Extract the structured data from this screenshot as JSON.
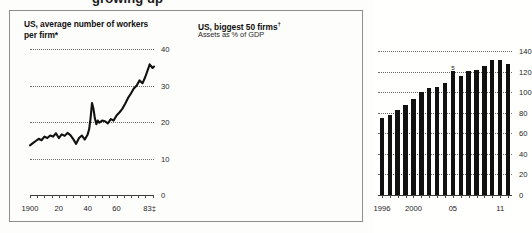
{
  "page": {
    "cropped_headline": "growing up",
    "frame_color": "#8d8d8d",
    "ink_color": "#111111"
  },
  "left_panel": {
    "title": "US, average number of workers",
    "title_line2": "per firm*",
    "title_footnote": "*",
    "y_ticks": [
      "0",
      "10",
      "20",
      "30",
      "40"
    ],
    "x_ticks": [
      "1900",
      "20",
      "40",
      "60",
      "83"
    ],
    "x_last_footnote": "‡"
  },
  "right_panel": {
    "title": "US, biggest 50 firms",
    "title_footnote": "†",
    "subtitle": "Assets as % of GDP",
    "y_ticks": [
      "0",
      "20",
      "40",
      "60",
      "80",
      "100",
      "120",
      "140"
    ],
    "x_ticks": [
      "1996",
      "2000",
      "05",
      "11"
    ],
    "bar_annotation": "5"
  },
  "chart_data": [
    {
      "type": "line",
      "title": "US, average number of workers per firm*",
      "xlabel": "",
      "ylabel": "",
      "xlim": [
        1900,
        1986
      ],
      "ylim": [
        0,
        40
      ],
      "grid": true,
      "legend": "none",
      "x_tick_values": [
        1900,
        1920,
        1940,
        1960,
        1983
      ],
      "x_tick_labels": [
        "1900",
        "20",
        "40",
        "60",
        "83‡"
      ],
      "y_tick_values": [
        0,
        10,
        20,
        30,
        40
      ],
      "y_tick_labels": [
        "0",
        "10",
        "20",
        "30",
        "40"
      ],
      "series": [
        {
          "name": "Average workers per firm",
          "x": [
            1900,
            1902,
            1904,
            1906,
            1908,
            1910,
            1912,
            1914,
            1916,
            1918,
            1920,
            1922,
            1924,
            1926,
            1928,
            1930,
            1932,
            1934,
            1936,
            1938,
            1940,
            1941,
            1942,
            1943,
            1944,
            1945,
            1946,
            1947,
            1948,
            1950,
            1952,
            1954,
            1956,
            1958,
            1960,
            1962,
            1964,
            1966,
            1968,
            1970,
            1972,
            1974,
            1976,
            1978,
            1980,
            1982,
            1983,
            1985,
            1986
          ],
          "y": [
            13.6,
            14.2,
            14.8,
            15.4,
            15.0,
            16.0,
            15.6,
            16.3,
            16.0,
            16.9,
            15.6,
            16.6,
            16.2,
            17.0,
            16.4,
            15.3,
            14.0,
            15.6,
            16.3,
            15.2,
            16.6,
            18.0,
            21.0,
            25.2,
            23.6,
            21.0,
            19.4,
            20.4,
            19.8,
            20.4,
            20.2,
            19.6,
            20.8,
            20.4,
            21.8,
            22.6,
            23.6,
            25.0,
            26.6,
            27.8,
            29.2,
            30.0,
            31.4,
            30.6,
            32.4,
            34.6,
            35.8,
            34.8,
            35.2
          ]
        }
      ]
    },
    {
      "type": "bar",
      "title": "US, biggest 50 firms†",
      "subtitle": "Assets as % of GDP",
      "xlabel": "",
      "ylabel": "Assets as % of GDP",
      "ylim": [
        0,
        140
      ],
      "grid": true,
      "legend": "none",
      "categories": [
        "1996",
        "1997",
        "1998",
        "1999",
        "2000",
        "2001",
        "2002",
        "2003",
        "2004",
        "2005",
        "2006",
        "2007",
        "2008",
        "2009",
        "2010",
        "2011",
        "2012"
      ],
      "x_tick_labels": [
        "1996",
        "2000",
        "05",
        "11"
      ],
      "y_tick_values": [
        0,
        20,
        40,
        60,
        80,
        100,
        120,
        140
      ],
      "y_tick_labels": [
        "0",
        "20",
        "40",
        "60",
        "80",
        "100",
        "120",
        "140"
      ],
      "values": [
        75,
        78,
        83,
        88,
        93,
        100,
        104,
        105,
        109,
        121,
        116,
        121,
        122,
        125,
        131,
        131,
        127
      ],
      "annotations": [
        {
          "category": "2005",
          "label": "5",
          "value": 121
        }
      ]
    }
  ]
}
